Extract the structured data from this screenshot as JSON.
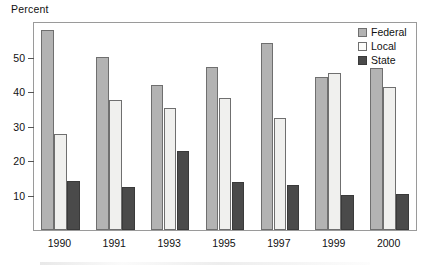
{
  "chart_data": {
    "type": "bar",
    "title": "",
    "ylabel": "Percent",
    "xlabel": "",
    "categories": [
      "1990",
      "1991",
      "1993",
      "1995",
      "1997",
      "1999",
      "2000"
    ],
    "series": [
      {
        "name": "Federal",
        "color": "#b3b3b3",
        "values": [
          57.5,
          49.8,
          41.5,
          46.8,
          53.8,
          44.0,
          46.5
        ]
      },
      {
        "name": "Local",
        "color": "#f0f0ee",
        "values": [
          27.5,
          37.3,
          35.0,
          38.0,
          32.3,
          45.0,
          41.0
        ]
      },
      {
        "name": "State",
        "color": "#4a4a4a",
        "values": [
          14.0,
          12.3,
          22.8,
          13.8,
          13.0,
          10.0,
          10.3
        ]
      }
    ],
    "yticks": [
      10,
      20,
      30,
      40,
      50
    ],
    "ytick_labels": [
      "10",
      "20",
      "30",
      "40",
      "50"
    ],
    "ylim": [
      0,
      60
    ],
    "grid": false,
    "legend_position": "top-right",
    "legend_entries": [
      "Federal",
      "Local",
      "State"
    ]
  },
  "legend": {
    "items": [
      {
        "label": "Federal",
        "swatch": "federal-swatch-icon"
      },
      {
        "label": "Local",
        "swatch": "local-swatch-icon"
      },
      {
        "label": "State",
        "swatch": "state-swatch-icon"
      }
    ]
  }
}
